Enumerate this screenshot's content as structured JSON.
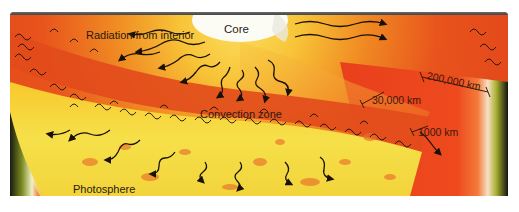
{
  "diagram": {
    "labels": {
      "core": "Core",
      "radiation": "Radiation from interior",
      "convection": "Convection zone",
      "photosphere": "Photosphere",
      "dim_200000": "200,000 km",
      "dim_30000": "30,000 km",
      "dim_1000": "1000 km"
    },
    "colors": {
      "interior_red": "#e8401a",
      "interior_orange": "#f0801e",
      "core_glow": "#f8d040",
      "core_white": "#fdfcf4",
      "photosphere_yellow": "#f4e040",
      "convection_red": "#e04a1c",
      "arrow_black": "#1a1208",
      "frame_top": "#5a5a5a",
      "space_dark": "#1a1a14",
      "limb_green": "#9aa828"
    }
  }
}
